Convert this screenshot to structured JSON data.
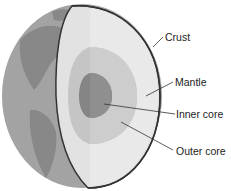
{
  "diagram": {
    "labels": [
      {
        "id": "crust",
        "text": "Crust"
      },
      {
        "id": "mantle",
        "text": "Mantle"
      },
      {
        "id": "inner_core",
        "text": "Inner core"
      },
      {
        "id": "outer_core",
        "text": "Outer core"
      }
    ],
    "colors": {
      "globe": "#9a9a9a",
      "land": "#7d7d7d",
      "crust_outline": "#333333",
      "mantle": "#e3e3e3",
      "outer_core": "#c4c4c4",
      "inner_core": "#8a8a8a",
      "leader_line": "#333333"
    }
  }
}
